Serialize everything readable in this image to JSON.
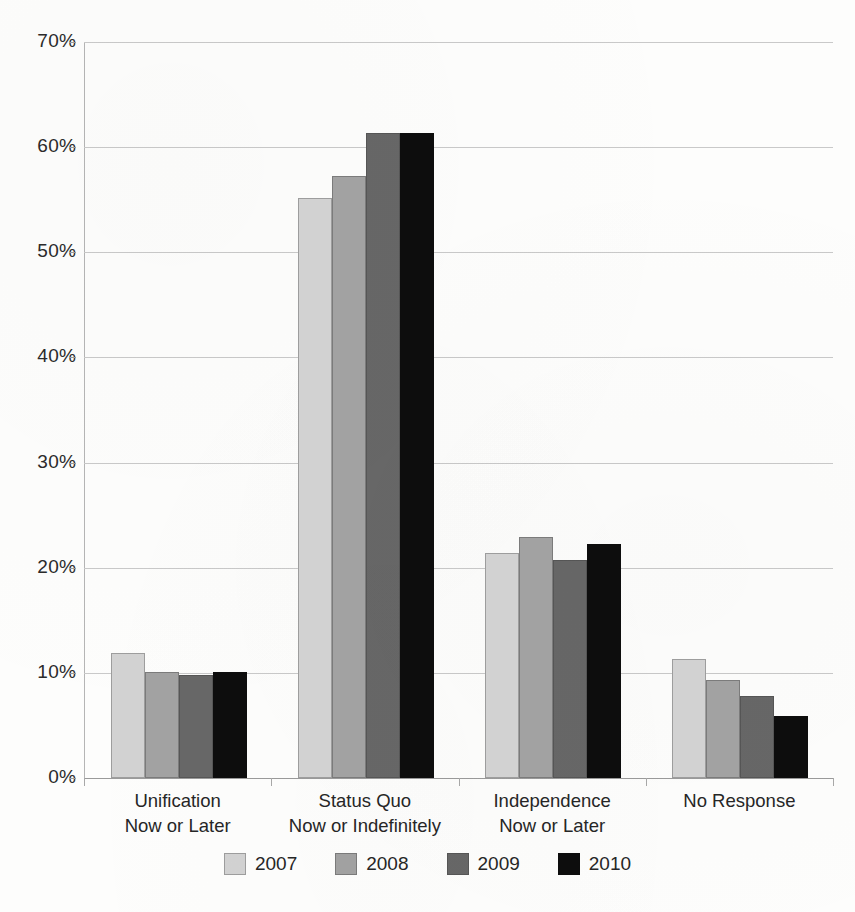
{
  "chart_data": {
    "type": "bar",
    "title": "",
    "subtitle": "",
    "xlabel": "",
    "ylabel": "",
    "ylim": [
      0,
      70
    ],
    "ytick_values": [
      0,
      10,
      20,
      30,
      40,
      50,
      60,
      70
    ],
    "ytick_labels": [
      "0%",
      "10%",
      "20%",
      "30%",
      "40%",
      "50%",
      "60%",
      "70%"
    ],
    "grid": true,
    "legend_position": "bottom",
    "categories": [
      "Unification\nNow or Later",
      "Status Quo\nNow or Indefinitely",
      "Independence\nNow or Later",
      "No Response"
    ],
    "category_lines": [
      [
        "Unification",
        "Now or Later"
      ],
      [
        "Status Quo",
        "Now or Indefinitely"
      ],
      [
        "Independence",
        "Now or Later"
      ],
      [
        "No Response",
        ""
      ]
    ],
    "series": [
      {
        "name": "2007",
        "color": "#d2d2d2",
        "values": [
          11.9,
          55.2,
          21.4,
          11.3
        ]
      },
      {
        "name": "2008",
        "color": "#a2a2a2",
        "values": [
          10.1,
          57.3,
          22.9,
          9.3
        ]
      },
      {
        "name": "2009",
        "color": "#676767",
        "values": [
          9.8,
          61.3,
          20.7,
          7.8
        ]
      },
      {
        "name": "2010",
        "color": "#0d0d0d",
        "values": [
          10.1,
          61.3,
          22.3,
          5.9
        ]
      }
    ]
  },
  "axis": {
    "ticks": [
      {
        "label": "70%",
        "value": 70
      },
      {
        "label": "60%",
        "value": 60
      },
      {
        "label": "50%",
        "value": 50
      },
      {
        "label": "40%",
        "value": 40
      },
      {
        "label": "30%",
        "value": 30
      },
      {
        "label": "20%",
        "value": 20
      },
      {
        "label": "10%",
        "value": 10
      },
      {
        "label": "0%",
        "value": 0
      }
    ]
  },
  "categories": [
    {
      "line1": "Unification",
      "line2": "Now or Later"
    },
    {
      "line1": "Status Quo",
      "line2": "Now or Indefinitely"
    },
    {
      "line1": "Independence",
      "line2": "Now or Later"
    },
    {
      "line1": "No Response",
      "line2": ""
    }
  ],
  "legend": {
    "items": [
      {
        "label": "2007",
        "color": "#d2d2d2"
      },
      {
        "label": "2008",
        "color": "#a2a2a2"
      },
      {
        "label": "2009",
        "color": "#676767"
      },
      {
        "label": "2010",
        "color": "#0d0d0d"
      }
    ]
  }
}
